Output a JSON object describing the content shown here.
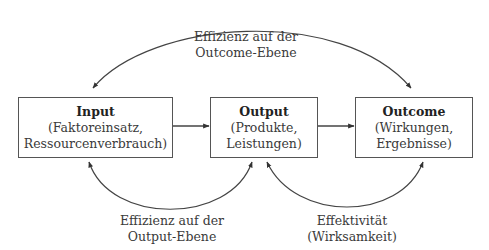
{
  "diagram": {
    "nodes": [
      {
        "id": "input",
        "title": "Input",
        "line1": "(Faktoreinsatz,",
        "line2": "Ressourcenverbrauch)"
      },
      {
        "id": "output",
        "title": "Output",
        "line1": "(Produkte,",
        "line2": "Leistungen)"
      },
      {
        "id": "outcome",
        "title": "Outcome",
        "line1": "(Wirkungen,",
        "line2": "Ergebnisse)"
      }
    ],
    "edges": [
      {
        "from": "input",
        "to": "output",
        "type": "straight-arrow"
      },
      {
        "from": "output",
        "to": "outcome",
        "type": "straight-arrow"
      },
      {
        "between": [
          "input",
          "outcome"
        ],
        "type": "double-headed-arc",
        "label_line1": "Effizienz auf der",
        "label_line2": "Outcome-Ebene"
      },
      {
        "between": [
          "input",
          "output"
        ],
        "type": "double-headed-arc",
        "label_line1": "Effizienz auf der",
        "label_line2": "Output-Ebene"
      },
      {
        "between": [
          "output",
          "outcome"
        ],
        "type": "double-headed-arc",
        "label_line1": "Effektivität",
        "label_line2": "(Wirksamkeit)"
      }
    ]
  },
  "colors": {
    "stroke": "#555555",
    "text": "#333333",
    "background": "#ffffff"
  }
}
